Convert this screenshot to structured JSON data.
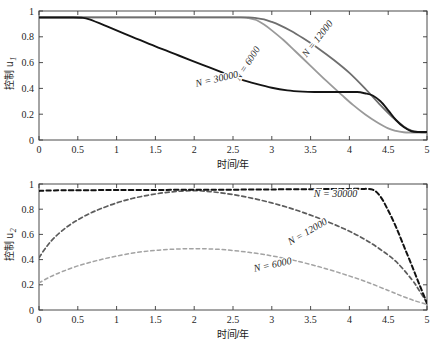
{
  "figure": {
    "panels": [
      "top",
      "bottom"
    ]
  },
  "chart_data": [
    {
      "id": "u1",
      "type": "line",
      "title": "",
      "xlabel": "时间/年",
      "ylabel": "控制 u",
      "ylabel_sub": "1",
      "xlim": [
        0,
        5
      ],
      "ylim": [
        0,
        1
      ],
      "xticks": [
        "0",
        "0.5",
        "1",
        "1.5",
        "2",
        "2.5",
        "3",
        "3.5",
        "4",
        "4.5",
        "5"
      ],
      "xtickvals": [
        0,
        0.5,
        1,
        1.5,
        2,
        2.5,
        3,
        3.5,
        4,
        4.5,
        5
      ],
      "yticks": [
        "0",
        "0.2",
        "0.4",
        "0.6",
        "0.8",
        "1"
      ],
      "ytickvals": [
        0,
        0.2,
        0.4,
        0.6,
        0.8,
        1
      ],
      "grid": false,
      "legend_position": "inline-annotations",
      "linestyle": "solid",
      "series": [
        {
          "name": "N = 6000",
          "color": "#9a9a9a",
          "width": 1.8,
          "label": "N = 6000",
          "label_x": 2.72,
          "label_y": 0.58,
          "label_rotation": -57,
          "x": [
            0,
            0.3,
            0.6,
            1.0,
            1.4,
            1.8,
            2.2,
            2.6,
            2.7,
            2.8,
            2.9,
            3.0,
            3.15,
            3.3,
            3.5,
            3.7,
            3.9,
            4.05,
            4.2,
            4.35,
            4.5,
            4.6,
            4.7,
            4.8,
            5.0
          ],
          "y": [
            0.95,
            0.95,
            0.95,
            0.95,
            0.95,
            0.95,
            0.95,
            0.95,
            0.945,
            0.93,
            0.895,
            0.85,
            0.775,
            0.69,
            0.575,
            0.46,
            0.35,
            0.27,
            0.2,
            0.14,
            0.09,
            0.07,
            0.06,
            0.058,
            0.058
          ]
        },
        {
          "name": "N = 12000",
          "color": "#6e6e6e",
          "width": 1.8,
          "label": "N = 12000",
          "label_x": 3.62,
          "label_y": 0.77,
          "label_rotation": -52,
          "x": [
            0,
            0.4,
            0.8,
            1.2,
            1.6,
            2.0,
            2.4,
            2.7,
            2.8,
            2.9,
            3.0,
            3.1,
            3.25,
            3.4,
            3.6,
            3.8,
            4.0,
            4.2,
            4.4,
            4.55,
            4.7,
            4.8,
            4.9,
            5.0
          ],
          "y": [
            0.95,
            0.95,
            0.95,
            0.95,
            0.95,
            0.95,
            0.95,
            0.95,
            0.945,
            0.935,
            0.915,
            0.89,
            0.845,
            0.79,
            0.71,
            0.62,
            0.52,
            0.4,
            0.27,
            0.18,
            0.105,
            0.072,
            0.062,
            0.06
          ]
        },
        {
          "name": "N = 30000",
          "color": "#141414",
          "width": 1.9,
          "label": "N = 30000",
          "label_x": 2.3,
          "label_y": 0.45,
          "label_rotation": -13,
          "x": [
            0,
            0.2,
            0.4,
            0.55,
            0.65,
            0.9,
            1.2,
            1.5,
            1.8,
            2.1,
            2.4,
            2.6,
            2.8,
            3.0,
            3.2,
            3.4,
            3.55,
            3.7,
            3.9,
            4.1,
            4.2,
            4.3,
            4.4,
            4.5,
            4.6,
            4.7,
            4.8,
            4.9,
            5.0
          ],
          "y": [
            0.95,
            0.95,
            0.95,
            0.948,
            0.935,
            0.875,
            0.8,
            0.725,
            0.655,
            0.585,
            0.515,
            0.47,
            0.435,
            0.405,
            0.385,
            0.375,
            0.372,
            0.372,
            0.372,
            0.372,
            0.362,
            0.345,
            0.3,
            0.23,
            0.155,
            0.1,
            0.068,
            0.062,
            0.062
          ]
        }
      ]
    },
    {
      "id": "u2",
      "type": "line",
      "title": "",
      "xlabel": "时间/年",
      "ylabel": "控制 u",
      "ylabel_sub": "2",
      "xlim": [
        0,
        5
      ],
      "ylim": [
        0,
        1
      ],
      "xticks": [
        "0",
        "0.5",
        "1",
        "1.5",
        "2",
        "2.5",
        "3",
        "3.5",
        "4",
        "4.5",
        "5"
      ],
      "xtickvals": [
        0,
        0.5,
        1,
        1.5,
        2,
        2.5,
        3,
        3.5,
        4,
        4.5,
        5
      ],
      "yticks": [
        "0",
        "0.2",
        "0.4",
        "0.6",
        "0.8",
        "1"
      ],
      "ytickvals": [
        0,
        0.2,
        0.4,
        0.6,
        0.8,
        1
      ],
      "grid": false,
      "legend_position": "inline-annotations",
      "linestyle": "dashed",
      "series": [
        {
          "name": "N = 6000",
          "color": "#a3a3a3",
          "width": 1.5,
          "dash": "3.5,3",
          "label": "N = 6000",
          "label_x": 3.02,
          "label_y": 0.335,
          "label_rotation": -12,
          "x": [
            0,
            0.15,
            0.3,
            0.5,
            0.7,
            0.9,
            1.1,
            1.3,
            1.5,
            1.7,
            1.9,
            2.1,
            2.3,
            2.5,
            2.7,
            2.9,
            3.1,
            3.3,
            3.6,
            3.9,
            4.2,
            4.5,
            4.7,
            4.85,
            5.0
          ],
          "y": [
            0.215,
            0.265,
            0.305,
            0.35,
            0.385,
            0.415,
            0.44,
            0.46,
            0.473,
            0.482,
            0.486,
            0.486,
            0.482,
            0.472,
            0.458,
            0.44,
            0.418,
            0.392,
            0.345,
            0.29,
            0.228,
            0.155,
            0.105,
            0.072,
            0.045
          ]
        },
        {
          "name": "N = 12000",
          "color": "#5c5c5c",
          "width": 1.7,
          "dash": "4,3",
          "label": "N = 12000",
          "label_x": 3.48,
          "label_y": 0.6,
          "label_rotation": -30,
          "x": [
            0,
            0.1,
            0.2,
            0.35,
            0.5,
            0.65,
            0.8,
            1.0,
            1.2,
            1.4,
            1.6,
            1.8,
            2.0,
            2.2,
            2.4,
            2.6,
            2.8,
            3.0,
            3.2,
            3.4,
            3.6,
            3.8,
            4.0,
            4.2,
            4.4,
            4.6,
            4.8,
            4.9,
            5.0
          ],
          "y": [
            0.415,
            0.505,
            0.575,
            0.655,
            0.715,
            0.765,
            0.805,
            0.85,
            0.885,
            0.91,
            0.93,
            0.942,
            0.948,
            0.94,
            0.925,
            0.905,
            0.88,
            0.85,
            0.815,
            0.775,
            0.73,
            0.68,
            0.625,
            0.56,
            0.48,
            0.385,
            0.245,
            0.155,
            0.055
          ]
        },
        {
          "name": "N = 30000",
          "color": "#121212",
          "width": 2.0,
          "dash": "4.5,3",
          "label": "N = 30000",
          "label_x": 3.82,
          "label_y": 0.895,
          "label_rotation": 0,
          "x": [
            0,
            0.1,
            0.3,
            0.6,
            1.0,
            1.5,
            2.0,
            2.5,
            3.0,
            3.5,
            3.8,
            4.0,
            4.15,
            4.3,
            4.4,
            4.5,
            4.6,
            4.7,
            4.8,
            4.9,
            5.0
          ],
          "y": [
            0.945,
            0.948,
            0.95,
            0.951,
            0.952,
            0.953,
            0.954,
            0.955,
            0.957,
            0.959,
            0.96,
            0.961,
            0.961,
            0.955,
            0.9,
            0.79,
            0.66,
            0.51,
            0.36,
            0.205,
            0.055
          ]
        }
      ]
    }
  ]
}
